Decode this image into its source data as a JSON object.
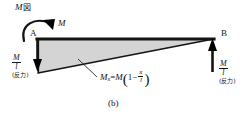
{
  "figure": {
    "title": "M図",
    "title_symbol": "M",
    "title_cjk": "図",
    "caption": "(b)",
    "type": "bending-moment-diagram"
  },
  "nodes": {
    "left_label": "A",
    "right_label": "B"
  },
  "applied_moment": {
    "label": "M",
    "direction": "clockwise-at-A"
  },
  "reactions": {
    "left": {
      "numerator": "M",
      "denominator": "l",
      "note": "(反力)",
      "direction": "down"
    },
    "right": {
      "numerator": "M",
      "denominator": "l",
      "note": "(反力)",
      "direction": "up"
    }
  },
  "equation": {
    "lhs_symbol": "M",
    "lhs_subscript": "x",
    "equals": "=",
    "rhs_symbol": "M",
    "open_paren": "(",
    "one": "1",
    "minus": "−",
    "frac_num": "x",
    "frac_den": "l",
    "close_paren": ")"
  },
  "colors": {
    "fill": "#d4d4d4",
    "stroke": "#141414",
    "background": "#ffffff"
  }
}
